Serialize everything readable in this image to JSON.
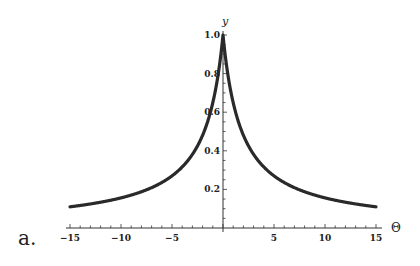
{
  "chart_data": {
    "type": "line",
    "title": "",
    "panel_label": "a.",
    "xlabel": "Θ",
    "ylabel": "y",
    "xlim": [
      -15,
      15
    ],
    "ylim": [
      0,
      1.0
    ],
    "x_ticks": [
      -15,
      -10,
      -5,
      5,
      10,
      15
    ],
    "x_tick_labels": [
      "-15",
      "-10",
      "-5",
      "5",
      "10",
      "15"
    ],
    "y_ticks": [
      0.2,
      0.4,
      0.6,
      0.8,
      1.0
    ],
    "y_tick_labels": [
      "0.2",
      "0.4",
      "0.6",
      "0.8",
      "1.0"
    ],
    "grid": false,
    "legend": null,
    "series": [
      {
        "name": "y(Θ)",
        "color": "#2a2a2a",
        "x": [
          -15,
          -12.5,
          -10,
          -7.5,
          -5,
          -4,
          -3,
          -2,
          -1.5,
          -1,
          -0.5,
          0,
          0.5,
          1,
          1.5,
          2,
          3,
          4,
          5,
          7.5,
          10,
          12.5,
          15
        ],
        "values": [
          0.11,
          0.13,
          0.16,
          0.2,
          0.27,
          0.32,
          0.38,
          0.48,
          0.55,
          0.65,
          0.79,
          1.0,
          0.79,
          0.65,
          0.55,
          0.48,
          0.38,
          0.32,
          0.27,
          0.2,
          0.16,
          0.13,
          0.11
        ]
      }
    ]
  }
}
